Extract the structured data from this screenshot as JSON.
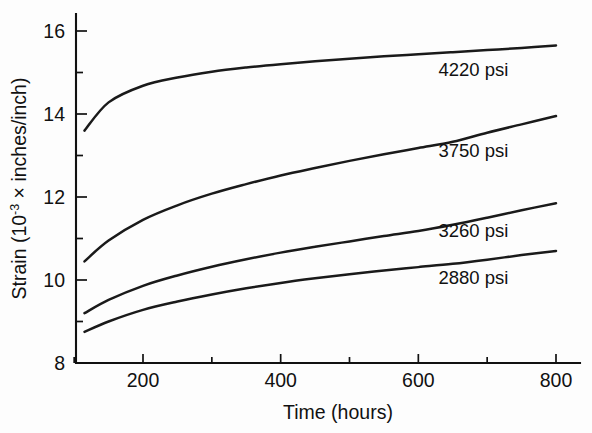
{
  "chart_data": {
    "type": "line",
    "title": "",
    "xlabel": "Time (hours)",
    "ylabel": "Strain (10-3 × inches/inch)",
    "ylabel_parts": {
      "prefix": "Strain (10",
      "exponent": "-3",
      "suffix": " × inches/inch)"
    },
    "xlim": [
      100,
      820
    ],
    "ylim": [
      8,
      16.35
    ],
    "grid": false,
    "legend_position": "inline-right-of-curves",
    "x_ticks_major": [
      200,
      400,
      600,
      800
    ],
    "x_tick_labels": [
      "200",
      "400",
      "600",
      "800"
    ],
    "x_ticks_minor": [
      100,
      300,
      500,
      700
    ],
    "y_ticks_major": [
      8,
      10,
      12,
      14,
      16
    ],
    "y_tick_labels": [
      "8",
      "10",
      "12",
      "14",
      "16"
    ],
    "y_ticks_minor": [
      9,
      11,
      13,
      15
    ],
    "x": [
      115,
      150,
      200,
      250,
      300,
      350,
      400,
      450,
      500,
      550,
      600,
      650,
      700,
      750,
      800
    ],
    "series": [
      {
        "name": "4220 psi",
        "label": "4220 psi",
        "label_x": 680,
        "label_y": 15.05,
        "values": [
          13.6,
          14.28,
          14.68,
          14.88,
          15.02,
          15.12,
          15.2,
          15.27,
          15.33,
          15.39,
          15.44,
          15.49,
          15.54,
          15.59,
          15.65
        ]
      },
      {
        "name": "3750 psi",
        "label": "3750 psi",
        "label_x": 680,
        "label_y": 13.1,
        "values": [
          10.45,
          10.95,
          11.45,
          11.8,
          12.08,
          12.31,
          12.52,
          12.7,
          12.87,
          13.03,
          13.18,
          13.33,
          13.55,
          13.75,
          13.95
        ]
      },
      {
        "name": "3260 psi",
        "label": "3260 psi",
        "label_x": 680,
        "label_y": 11.18,
        "values": [
          9.2,
          9.52,
          9.86,
          10.11,
          10.32,
          10.5,
          10.66,
          10.8,
          10.93,
          11.06,
          11.18,
          11.33,
          11.5,
          11.68,
          11.85
        ]
      },
      {
        "name": "2880 psi",
        "label": "2880 psi",
        "label_x": 680,
        "label_y": 10.05,
        "values": [
          8.75,
          9.0,
          9.28,
          9.48,
          9.65,
          9.8,
          9.93,
          10.04,
          10.14,
          10.23,
          10.31,
          10.39,
          10.49,
          10.6,
          10.7
        ]
      }
    ],
    "colors": {
      "curve": "#1a1a1a",
      "axis": "#111111",
      "background": "#fdfdfd"
    }
  }
}
